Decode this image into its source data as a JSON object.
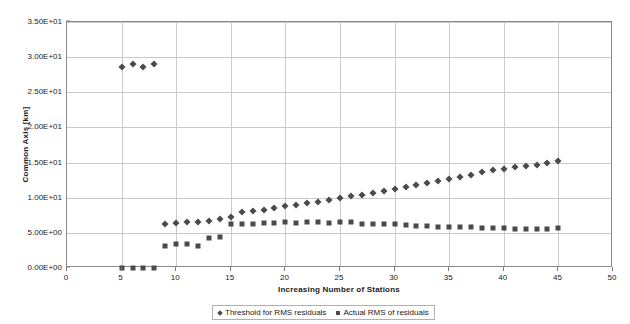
{
  "chart_data": {
    "type": "scatter",
    "title": "",
    "xlabel": "Increasing Number of Stations",
    "ylabel": "Common Axis [km]",
    "xlim": [
      0,
      50
    ],
    "ylim": [
      0,
      35
    ],
    "x_tick_labels": [
      "0",
      "5",
      "10",
      "15",
      "20",
      "25",
      "30",
      "35",
      "40",
      "45",
      "50"
    ],
    "x_tick_values": [
      0,
      5,
      10,
      15,
      20,
      25,
      30,
      35,
      40,
      45,
      50
    ],
    "y_tick_labels": [
      "0.00E+00",
      "5.00E+00",
      "1.00E+01",
      "1.50E+01",
      "2.00E+01",
      "2.50E+01",
      "3.00E+01",
      "3.50E+01"
    ],
    "y_tick_values": [
      0,
      5,
      10,
      15,
      20,
      25,
      30,
      35
    ],
    "grid": "both",
    "legend_position": "bottom",
    "marker_color": "#4a4a4a",
    "series": [
      {
        "name": "Threshold for RMS residuals",
        "marker": "diamond",
        "x": [
          5,
          6,
          7,
          8,
          9,
          10,
          11,
          12,
          13,
          14,
          15,
          16,
          17,
          18,
          19,
          20,
          21,
          22,
          23,
          24,
          25,
          26,
          27,
          28,
          29,
          30,
          31,
          32,
          33,
          34,
          35,
          36,
          37,
          38,
          39,
          40,
          41,
          42,
          43,
          44,
          45
        ],
        "values": [
          28.6,
          29.0,
          28.6,
          29.0,
          6.3,
          6.4,
          6.5,
          6.6,
          6.7,
          7.0,
          7.2,
          7.9,
          8.1,
          8.3,
          8.5,
          8.8,
          9.0,
          9.2,
          9.4,
          9.7,
          10.0,
          10.2,
          10.4,
          10.6,
          10.9,
          11.2,
          11.5,
          11.8,
          12.1,
          12.4,
          12.7,
          13.0,
          13.3,
          13.6,
          13.9,
          14.1,
          14.3,
          14.5,
          14.7,
          14.9,
          15.2
        ]
      },
      {
        "name": "Actual RMS of residuals",
        "marker": "square",
        "x": [
          5,
          6,
          7,
          8,
          9,
          10,
          11,
          12,
          13,
          14,
          15,
          16,
          17,
          18,
          19,
          20,
          21,
          22,
          23,
          24,
          25,
          26,
          27,
          28,
          29,
          30,
          31,
          32,
          33,
          34,
          35,
          36,
          37,
          38,
          39,
          40,
          41,
          42,
          43,
          44,
          45
        ],
        "values": [
          0.0,
          0.0,
          0.0,
          0.0,
          3.2,
          3.4,
          3.4,
          3.2,
          4.3,
          4.4,
          6.3,
          6.3,
          6.2,
          6.4,
          6.4,
          6.5,
          6.4,
          6.6,
          6.5,
          6.4,
          6.6,
          6.5,
          6.3,
          6.3,
          6.2,
          6.2,
          6.1,
          6.0,
          6.0,
          5.9,
          5.9,
          5.8,
          5.8,
          5.7,
          5.7,
          5.7,
          5.6,
          5.6,
          5.6,
          5.6,
          5.7
        ]
      }
    ]
  },
  "legend": {
    "entries": [
      {
        "label": "Threshold for RMS residuals"
      },
      {
        "label": "Actual RMS of residuals"
      }
    ]
  }
}
